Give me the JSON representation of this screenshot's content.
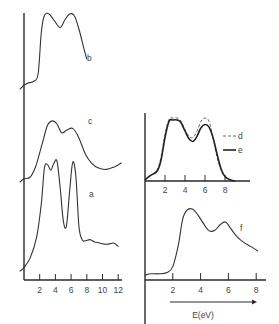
{
  "chart_data": [
    {
      "type": "line",
      "panel": "left",
      "title": "",
      "xlabel": "",
      "ylabel": "",
      "xlim": [
        0,
        12
      ],
      "x_ticks": [
        2,
        4,
        6,
        8,
        10,
        12
      ],
      "x_tick_labels": [
        "2",
        "4",
        "6",
        "8",
        "10",
        "12"
      ],
      "grid": false,
      "series": [
        {
          "name": "b",
          "label": "b",
          "style": "solid",
          "x": [
            -0.5,
            0,
            0.5,
            1.2,
            1.8,
            2.2,
            2.6,
            3.2,
            3.8,
            4.6,
            5.2,
            5.8,
            6.4,
            7.0,
            7.6,
            8.0
          ],
          "y": [
            0.0,
            0.05,
            0.08,
            0.1,
            0.2,
            0.75,
            0.98,
            1.0,
            0.92,
            0.82,
            0.92,
            1.0,
            0.98,
            0.8,
            0.55,
            0.4
          ]
        },
        {
          "name": "c",
          "label": "c",
          "style": "solid",
          "x": [
            -0.5,
            0,
            0.8,
            1.5,
            2.3,
            3.0,
            3.6,
            4.2,
            4.8,
            5.4,
            6.2,
            7.0,
            7.8,
            8.6,
            9.5,
            10.5,
            11.5,
            12.4
          ],
          "y": [
            0.0,
            0.05,
            0.08,
            0.25,
            0.6,
            0.9,
            0.97,
            0.92,
            0.78,
            0.82,
            0.85,
            0.7,
            0.45,
            0.3,
            0.22,
            0.2,
            0.24,
            0.3
          ]
        },
        {
          "name": "a",
          "label": "a",
          "style": "solid",
          "x": [
            -0.5,
            0,
            0.8,
            1.6,
            2.2,
            2.6,
            3.0,
            3.4,
            3.8,
            4.2,
            4.6,
            5.0,
            5.4,
            5.8,
            6.2,
            6.6,
            7.0,
            7.4,
            7.8,
            8.4,
            9.0,
            9.6,
            10.2,
            10.8,
            11.4,
            12.0
          ],
          "y": [
            0.0,
            0.03,
            0.12,
            0.3,
            0.6,
            0.92,
            0.95,
            0.9,
            0.96,
            0.98,
            0.75,
            0.45,
            0.4,
            0.7,
            0.97,
            0.85,
            0.4,
            0.28,
            0.27,
            0.28,
            0.26,
            0.25,
            0.24,
            0.24,
            0.25,
            0.22
          ]
        }
      ]
    },
    {
      "type": "line",
      "panel": "right-upper",
      "title": "",
      "xlabel": "",
      "ylabel": "",
      "xlim": [
        0,
        10
      ],
      "x_ticks": [
        2,
        4,
        6,
        8
      ],
      "x_tick_labels": [
        "2",
        "4",
        "6",
        "8"
      ],
      "grid": false,
      "legend": [
        {
          "name": "d",
          "style": "dashed"
        },
        {
          "name": "e",
          "style": "solid"
        }
      ],
      "legend_position": "right",
      "series": [
        {
          "name": "d",
          "label": "d",
          "style": "dashed",
          "x": [
            0,
            0.6,
            1.2,
            1.6,
            2.0,
            2.4,
            2.8,
            3.2,
            3.6,
            4.0,
            4.4,
            4.8,
            5.2,
            5.6,
            6.0,
            6.4,
            6.8,
            7.2,
            7.6,
            8.0,
            8.5,
            9.0
          ],
          "y": [
            0.05,
            0.12,
            0.2,
            0.4,
            0.75,
            0.98,
            1.0,
            1.0,
            0.95,
            0.82,
            0.72,
            0.7,
            0.8,
            0.95,
            1.0,
            0.95,
            0.7,
            0.4,
            0.2,
            0.1,
            0.05,
            0.03
          ]
        },
        {
          "name": "e",
          "label": "e",
          "style": "solid",
          "x": [
            0,
            0.6,
            1.2,
            1.6,
            2.0,
            2.4,
            2.8,
            3.2,
            3.6,
            4.0,
            4.4,
            4.8,
            5.2,
            5.6,
            6.0,
            6.4,
            6.8,
            7.2,
            7.6,
            8.0,
            8.5,
            9.0
          ],
          "y": [
            0.05,
            0.12,
            0.18,
            0.35,
            0.7,
            0.95,
            0.97,
            0.97,
            0.93,
            0.8,
            0.68,
            0.64,
            0.72,
            0.85,
            0.9,
            0.86,
            0.7,
            0.45,
            0.22,
            0.1,
            0.05,
            0.03
          ]
        }
      ]
    },
    {
      "type": "line",
      "panel": "right-lower",
      "title": "",
      "xlabel": "E(eV)",
      "ylabel": "",
      "xlim": [
        0,
        8.5
      ],
      "x_ticks": [
        2,
        4,
        6,
        8
      ],
      "x_tick_labels": [
        "2",
        "4",
        "6",
        "8"
      ],
      "grid": false,
      "series": [
        {
          "name": "f",
          "label": "f",
          "style": "solid",
          "x": [
            0,
            0.4,
            1.0,
            1.6,
            2.0,
            2.4,
            2.7,
            3.0,
            3.4,
            3.8,
            4.2,
            4.6,
            5.0,
            5.4,
            5.8,
            6.2,
            6.6,
            7.0,
            7.6,
            8.1
          ],
          "y": [
            0.08,
            0.1,
            0.1,
            0.12,
            0.2,
            0.5,
            0.85,
            0.98,
            1.0,
            0.92,
            0.8,
            0.7,
            0.7,
            0.78,
            0.82,
            0.72,
            0.62,
            0.55,
            0.48,
            0.42
          ]
        }
      ]
    }
  ]
}
